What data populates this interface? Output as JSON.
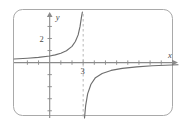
{
  "figure": {
    "frame": {
      "name": "rounded-panel",
      "x": 13,
      "y": 9,
      "width": 159,
      "height": 106,
      "radius": 9,
      "stroke": "#a9a9a9",
      "fill": "#ffffff"
    },
    "background": "#ffffff"
  },
  "chart_data": {
    "type": "line",
    "title": "",
    "xlabel": "x",
    "ylabel": "y",
    "grid": false,
    "legend": null,
    "xlim": [
      -3.2,
      11.5
    ],
    "ylim": [
      -4.6,
      4.2
    ],
    "axes": {
      "x_axis_y_value": 0,
      "y_axis_x_value": 0,
      "arrows": [
        "x-positive",
        "y-positive"
      ]
    },
    "tick_labels": {
      "x": [
        {
          "value": 3,
          "text": "3"
        }
      ],
      "y": [
        {
          "value": 2,
          "text": "2"
        }
      ]
    },
    "x_ticks": [
      -2,
      -1,
      1,
      2,
      3,
      4,
      5,
      6,
      7,
      8,
      9,
      10
    ],
    "y_ticks": [
      -4,
      -3,
      -2,
      -1,
      1,
      2,
      3
    ],
    "asymptotes": [
      {
        "kind": "vertical",
        "value": 3,
        "style": "dashed",
        "color": "#b0b0b0"
      },
      {
        "kind": "horizontal",
        "value": 0,
        "style": "solid-axis",
        "color": "#8a8a8a"
      }
    ],
    "series": [
      {
        "name": "left-branch",
        "description": "increasing branch approaching y=0 from above as x decreases and +infinity as x approaches 3 from the left",
        "color": "#6e6e6e",
        "points": [
          {
            "x": -3.2,
            "y": 0.3
          },
          {
            "x": -2.0,
            "y": 0.36
          },
          {
            "x": -1.0,
            "y": 0.43
          },
          {
            "x": 0.0,
            "y": 0.55
          },
          {
            "x": 0.5,
            "y": 0.64
          },
          {
            "x": 1.0,
            "y": 0.78
          },
          {
            "x": 1.5,
            "y": 0.98
          },
          {
            "x": 2.0,
            "y": 1.35
          },
          {
            "x": 2.3,
            "y": 1.75
          },
          {
            "x": 2.55,
            "y": 2.3
          },
          {
            "x": 2.72,
            "y": 3.0
          },
          {
            "x": 2.85,
            "y": 3.8
          },
          {
            "x": 2.93,
            "y": 4.2
          }
        ]
      },
      {
        "name": "right-branch",
        "description": "increasing branch rising from -infinity at x=3 from the right toward y=0 from below",
        "color": "#6e6e6e",
        "points": [
          {
            "x": 3.12,
            "y": -4.6
          },
          {
            "x": 3.22,
            "y": -3.6
          },
          {
            "x": 3.4,
            "y": -2.6
          },
          {
            "x": 3.7,
            "y": -1.8
          },
          {
            "x": 4.1,
            "y": -1.25
          },
          {
            "x": 4.7,
            "y": -0.9
          },
          {
            "x": 5.5,
            "y": -0.65
          },
          {
            "x": 6.5,
            "y": -0.48
          },
          {
            "x": 7.8,
            "y": -0.35
          },
          {
            "x": 9.2,
            "y": -0.26
          },
          {
            "x": 11.5,
            "y": -0.18
          }
        ]
      }
    ]
  }
}
